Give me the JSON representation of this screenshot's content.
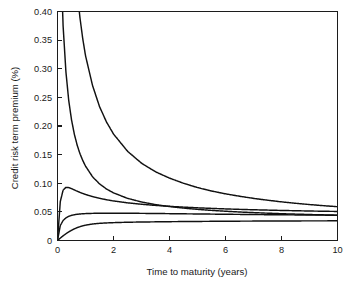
{
  "chart_data": {
    "type": "line",
    "title": "",
    "xlabel": "Time to maturity (years)",
    "ylabel": "Credit risk term premium (%)",
    "xlim": [
      0,
      10
    ],
    "ylim": [
      0,
      0.4
    ],
    "grid": false,
    "legend": "none",
    "xticks": [
      "0",
      "2",
      "4",
      "6",
      "8",
      "10"
    ],
    "xtick_values": [
      0,
      2,
      4,
      6,
      8,
      10
    ],
    "yticks": [
      "0",
      "0.05",
      "0.10",
      "0.15",
      "0.20",
      "0.25",
      "0.30",
      "0.35",
      "0.40"
    ],
    "ytick_values": [
      0,
      0.05,
      0.1,
      0.15,
      0.2,
      0.25,
      0.3,
      0.35,
      0.4
    ],
    "x": [
      0,
      0.1,
      0.2,
      0.3,
      0.4,
      0.5,
      0.6,
      0.7,
      0.8,
      0.9,
      1.0,
      1.25,
      1.5,
      1.75,
      2.0,
      2.5,
      3.0,
      3.5,
      4.0,
      4.5,
      5.0,
      5.5,
      6.0,
      6.5,
      7.0,
      7.5,
      8.0,
      8.5,
      9.0,
      9.5,
      10.0
    ],
    "series": [
      {
        "name": "curve-1",
        "values": [
          2.4,
          1.7,
          1.25,
          0.95,
          0.74,
          0.6,
          0.505,
          0.437,
          0.39,
          0.353,
          0.323,
          0.271,
          0.234,
          0.207,
          0.186,
          0.156,
          0.135,
          0.12,
          0.109,
          0.1,
          0.0925,
          0.0865,
          0.0815,
          0.0773,
          0.0736,
          0.0704,
          0.0675,
          0.065,
          0.0628,
          0.0608,
          0.059
        ]
      },
      {
        "name": "curve-2",
        "values": [
          0.8,
          0.52,
          0.375,
          0.295,
          0.245,
          0.211,
          0.186,
          0.167,
          0.152,
          0.14,
          0.13,
          0.1115,
          0.099,
          0.09,
          0.0832,
          0.0737,
          0.0673,
          0.0627,
          0.0593,
          0.0566,
          0.0544,
          0.0526,
          0.0511,
          0.0498,
          0.0487,
          0.0477,
          0.0468,
          0.0461,
          0.0454,
          0.0448,
          0.0442
        ]
      },
      {
        "name": "curve-3",
        "values": [
          0.0,
          0.068,
          0.088,
          0.0928,
          0.0925,
          0.0906,
          0.0884,
          0.0862,
          0.0841,
          0.0822,
          0.0804,
          0.0767,
          0.0737,
          0.0712,
          0.0691,
          0.0658,
          0.0633,
          0.0613,
          0.0597,
          0.0583,
          0.0571,
          0.0561,
          0.0552,
          0.0544,
          0.0537,
          0.0531,
          0.0525,
          0.052,
          0.0515,
          0.0511,
          0.0507
        ]
      },
      {
        "name": "curve-4",
        "values": [
          0.0,
          0.0262,
          0.035,
          0.0395,
          0.0422,
          0.0439,
          0.045,
          0.0458,
          0.0463,
          0.0467,
          0.047,
          0.0474,
          0.0476,
          0.0477,
          0.0477,
          0.0476,
          0.0474,
          0.0472,
          0.0469,
          0.0466,
          0.0464,
          0.0461,
          0.0458,
          0.0456,
          0.0453,
          0.0451,
          0.0449,
          0.0447,
          0.0445,
          0.0443,
          0.0441
        ]
      },
      {
        "name": "curve-5",
        "values": [
          0.0,
          0.0042,
          0.0082,
          0.0118,
          0.015,
          0.0178,
          0.0203,
          0.0224,
          0.0242,
          0.0256,
          0.0268,
          0.0288,
          0.03,
          0.0307,
          0.0312,
          0.0319,
          0.0323,
          0.0326,
          0.0329,
          0.0331,
          0.0333,
          0.0335,
          0.0336,
          0.0338,
          0.0339,
          0.034,
          0.0341,
          0.0342,
          0.0343,
          0.0343,
          0.0344
        ]
      }
    ]
  },
  "axes": {
    "x_label": "Time to maturity (years)",
    "y_label": "Credit risk term premium (%)"
  }
}
